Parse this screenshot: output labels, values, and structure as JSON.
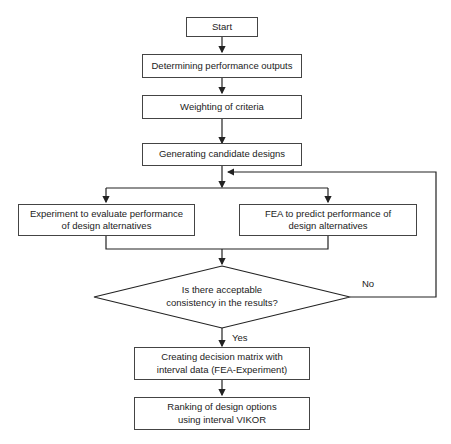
{
  "flowchart": {
    "nodes": {
      "start": "Start",
      "determine": "Determining performance outputs",
      "weighting": "Weighting of criteria",
      "generate": "Generating candidate designs",
      "experiment": "Experiment to evaluate performance of design alternatives",
      "fea": "FEA to predict performance of design alternatives",
      "decision": "Is there acceptable consistency in the results?",
      "matrix": "Creating decision matrix with interval data (FEA-Experiment)",
      "ranking": "Ranking of design options using interval VIKOR"
    },
    "edges": {
      "no": "No",
      "yes": "Yes"
    }
  }
}
